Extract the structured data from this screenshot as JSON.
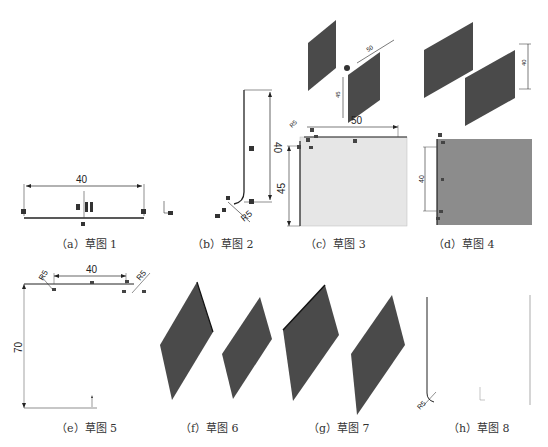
{
  "figure": {
    "panels": [
      {
        "id": "a",
        "caption": "（a）草图 1",
        "dimensions": {
          "width": "40"
        }
      },
      {
        "id": "b",
        "caption": "（b）草图 2",
        "dimensions": {
          "height": "40",
          "radius": "R5"
        }
      },
      {
        "id": "c",
        "caption": "（c）草图 3",
        "dimensions": {
          "width": "50",
          "height": "45",
          "radius": "R5",
          "iso_width": "50",
          "iso_height": "45"
        }
      },
      {
        "id": "d",
        "caption": "（d）草图 4",
        "dimensions": {
          "height": "40",
          "iso_height": "40"
        }
      },
      {
        "id": "e",
        "caption": "（e）草图 5",
        "dimensions": {
          "width": "40",
          "height": "70",
          "radius_left": "R5",
          "radius_right": "R5"
        }
      },
      {
        "id": "f",
        "caption": "（f）草图 6"
      },
      {
        "id": "g",
        "caption": "（g）草图 7"
      },
      {
        "id": "h",
        "caption": "（h）草图 8",
        "dimensions": {
          "radius": "R5"
        }
      }
    ]
  },
  "colors": {
    "sheet_dark": "#4a4a4a",
    "sheet_c_fill": "#e6e6e6",
    "sheet_d_fill": "#8c8c8c",
    "line": "#222222"
  }
}
